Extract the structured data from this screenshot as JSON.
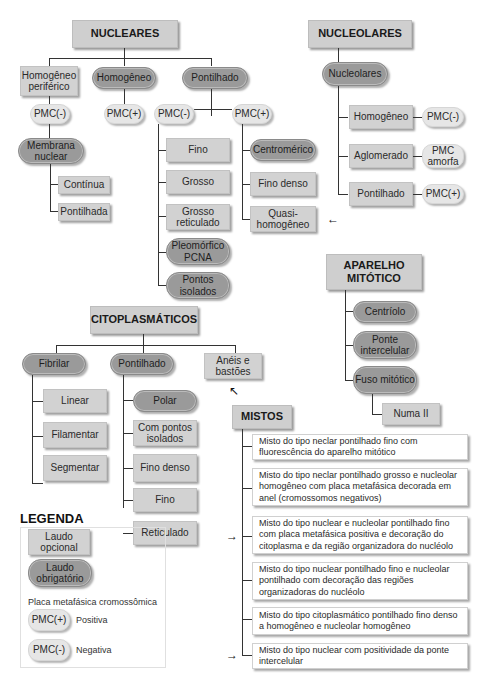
{
  "nucleares": {
    "title": "NUCLEARES",
    "homogeneo_periferico": "Homogêneo periférico",
    "homogeneo": "Homogêneo",
    "pontilhado": "Pontilhado",
    "pmc_neg_a": "PMC(-)",
    "pmc_pos_a": "PMC(+)",
    "pmc_neg_b": "PMC(-)",
    "pmc_pos_b": "PMC(+)",
    "membrana_nuclear": "Membrana nuclear",
    "continua": "Contínua",
    "pontilhada": "Pontilhada",
    "neg_children": [
      "Fino",
      "Grosso",
      "Grosso reticulado",
      "Pleomórfico PCNA",
      "Pontos isolados"
    ],
    "pos_children": [
      "Centromérico",
      "Fino denso",
      "Quasi-homogêneo"
    ]
  },
  "nucleolares": {
    "title": "NUCLEOLARES",
    "root": "Nucleolares",
    "rows": [
      {
        "label": "Homogêneo",
        "pmc": "PMC(-)"
      },
      {
        "label": "Aglomerado",
        "pmc": "PMC amorfa"
      },
      {
        "label": "Pontilhado",
        "pmc": "PMC(+)"
      }
    ]
  },
  "aparelho_mitotico": {
    "title": "APARELHO MITÓTICO",
    "children": [
      "Centríolo",
      "Ponte intercelular",
      "Fuso mitótico"
    ],
    "fuso_child": "Numa II"
  },
  "citoplasmaticos": {
    "title": "CITOPLASMÁTICOS",
    "fibrilar": "Fibrilar",
    "pontilhado": "Pontilhado",
    "aneis": "Anéis e bastões",
    "fibrilar_children": [
      "Linear",
      "Filamentar",
      "Segmentar"
    ],
    "pontilhado_children": [
      "Polar",
      "Com pontos isolados",
      "Fino denso",
      "Fino",
      "Reticulado"
    ]
  },
  "mistos": {
    "title": "MISTOS",
    "items": [
      "Misto do tipo neclar pontilhado fino com fluorescência do aparelho mitótico",
      "Misto do tipo neclar pontilhado grosso e nucleolar homogêneo com placa metafásica decorada em anel (cromossomos negativos)",
      "Misto do tipo nuclear e nucleolar pontilhado fino com placa metafásica positiva e decoração do citoplasma e da região organizadora do nucléolo",
      "Misto do tipo nuclear pontilhado fino e nucleolar pontilhado com decoração das regiões organizadoras do nucléolo",
      "Misto do tipo citoplasmático pontilhado fino denso a homogêneo e nucleolar homogêneo",
      "Misto do tipo nuclear com positividade da ponte intercelular"
    ]
  },
  "legenda": {
    "title": "LEGENDA",
    "opcional": "Laudo opcional",
    "obrigatorio": "Laudo obrigatório",
    "placa": "Placa metafásica cromossômica",
    "pmc_pos": "PMC(+)",
    "pos_label": "Positiva",
    "pmc_neg": "PMC(-)",
    "neg_label": "Negativa"
  },
  "arrows": {
    "glyph_left": "←",
    "glyph_right": "→",
    "glyph_upleft": "↖"
  }
}
